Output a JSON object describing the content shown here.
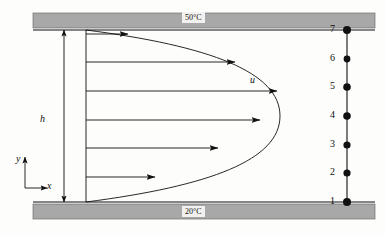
{
  "figure": {
    "background_color": "#fdfdfc",
    "ink_color": "#111111",
    "wall_color": "#a8a8a8",
    "label_background": "#f2f1ef"
  },
  "walls": {
    "top": {
      "temperature_label": "50°C",
      "name": "top-plate"
    },
    "bottom": {
      "temperature_label": "20°C",
      "name": "bottom-plate"
    }
  },
  "annotations": {
    "height_label": "h",
    "velocity_label": "u",
    "axis_x_label": "x",
    "axis_y_label": "y"
  },
  "nodes": [
    {
      "label": "1",
      "y": 202
    },
    {
      "label": "2",
      "y": 173
    },
    {
      "label": "3",
      "y": 145
    },
    {
      "label": "4",
      "y": 116
    },
    {
      "label": "5",
      "y": 87
    },
    {
      "label": "6",
      "y": 59
    },
    {
      "label": "7",
      "y": 30
    }
  ],
  "node_column_x": 347,
  "velocity_arrows": [
    {
      "y": 177,
      "x_start": 86,
      "x_end": 155
    },
    {
      "y": 148,
      "x_start": 86,
      "x_end": 218
    },
    {
      "y": 120,
      "x_start": 86,
      "x_end": 260
    },
    {
      "y": 91,
      "x_start": 86,
      "x_end": 277
    },
    {
      "y": 62,
      "x_start": 86,
      "x_end": 235
    },
    {
      "y": 34,
      "x_start": 86,
      "x_end": 128
    }
  ],
  "profile_curve": {
    "description": "parabolic velocity profile, zero at both walls, maximum at mid-channel",
    "wall_top_y": 30,
    "wall_bottom_y": 202,
    "base_x": 86,
    "max_x": 280
  },
  "chart_data": {
    "type": "line",
    "xlabel": "u",
    "ylabel": "y",
    "categories": [
      "1",
      "2",
      "3",
      "4",
      "5",
      "6",
      "7"
    ],
    "series": [
      {
        "name": "velocity magnitude (relative)",
        "values": [
          0.0,
          0.36,
          0.68,
          0.9,
          0.99,
          0.77,
          0.0
        ]
      }
    ],
    "annotations": [
      "50°C",
      "20°C",
      "h",
      "u",
      "x",
      "y"
    ],
    "grid": false,
    "legend": "none"
  }
}
